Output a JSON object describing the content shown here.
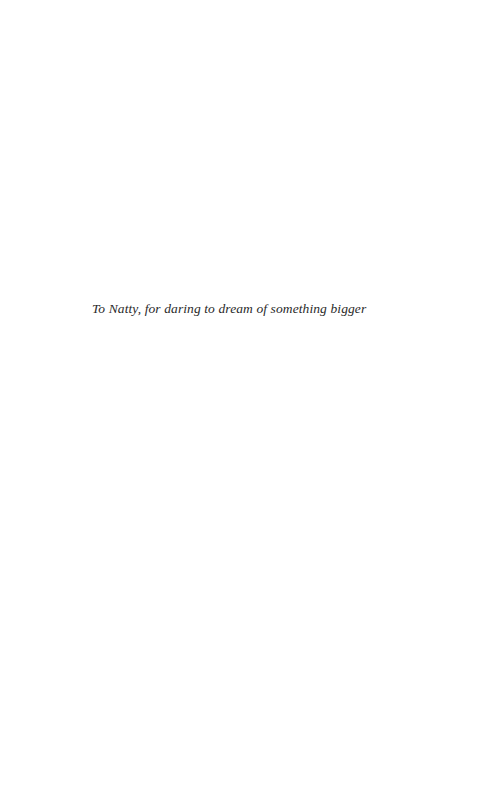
{
  "page": {
    "dedication": "To Natty, for daring to dream of something bigger"
  }
}
